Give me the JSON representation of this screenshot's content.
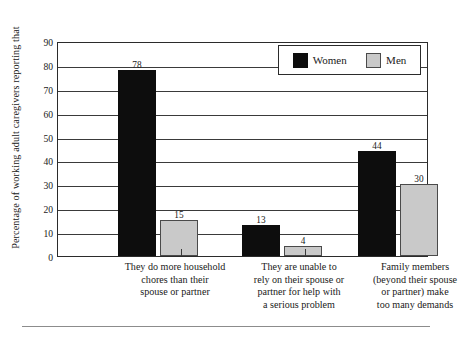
{
  "chart_data": {
    "type": "bar",
    "title": "",
    "xlabel": "",
    "ylabel": "Percentage of working adult caregivers reporting that",
    "ylim": [
      0,
      90
    ],
    "ytick_labels": [
      "0",
      "10",
      "20",
      "30",
      "40",
      "50",
      "60",
      "70",
      "80",
      "90"
    ],
    "ytick_values": [
      0,
      10,
      20,
      30,
      40,
      50,
      60,
      70,
      80,
      90
    ],
    "grid": true,
    "legend_position": "top-right",
    "categories": [
      "They do more household chores than their spouse or partner",
      "They are unable to rely on their spouse or partner for help with a serious problem",
      "Family members (beyond their spouse or partner) make too many demands"
    ],
    "category_lines": [
      [
        "They do more household",
        "chores than their",
        "spouse or partner"
      ],
      [
        "They are unable to",
        "rely on their spouse or",
        "partner for help with",
        "a serious problem"
      ],
      [
        "Family members",
        "(beyond their spouse",
        "or partner) make",
        "too many demands"
      ]
    ],
    "series": [
      {
        "name": "Women",
        "color": "#0d0d0d",
        "values": [
          78,
          13,
          44
        ]
      },
      {
        "name": "Men",
        "color": "#c9c9c9",
        "values": [
          15,
          4,
          30
        ]
      }
    ]
  },
  "legend": {
    "entries": [
      {
        "label": "Women",
        "swatch": "black-swatch"
      },
      {
        "label": "Men",
        "swatch": "gray-swatch"
      }
    ]
  }
}
